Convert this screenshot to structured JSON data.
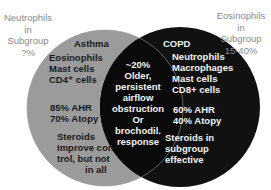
{
  "colors": {
    "left_circle": "#9b9b9b",
    "right_circle": "#111111",
    "overlap": "#0a0a0a",
    "outer_text": "#8a8a8a"
  },
  "outer_left": {
    "lines": [
      "Neutrophils",
      "in",
      "Subgroup",
      "?%"
    ]
  },
  "outer_right": {
    "lines": [
      "Eosinophils",
      "in",
      "Subgroup",
      "15-40%"
    ]
  },
  "asthma": {
    "title": "Asthma",
    "cells": [
      "Eosinophils",
      "Mast cells",
      "CD4⁺ cells"
    ],
    "stats": [
      "85% AHR",
      "70% Atopy"
    ],
    "steroids": [
      "Steroids",
      "Improve con-",
      "trol, but not",
      "in all"
    ]
  },
  "overlap": {
    "lines": [
      "~20%",
      "Older,",
      "persistent",
      "airflow",
      "obstruction",
      "Or",
      "brochodil.",
      "response"
    ]
  },
  "copd": {
    "title": "COPD",
    "cells": [
      "Neutrophils",
      "Macrophages",
      "Mast cells",
      "CD8+ cells"
    ],
    "stats": [
      "60% AHR",
      "40% Atopy"
    ],
    "steroids": [
      "Steroids in",
      "subgroup",
      "effective"
    ]
  }
}
